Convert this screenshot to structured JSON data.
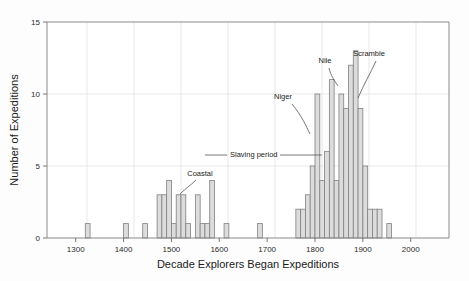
{
  "figure": {
    "name": "histogram-expeditions",
    "background_color": "#fdfdfd",
    "frame_color": "#888888",
    "grid_color": "#dddddd",
    "bar_fill": "#dcdcdc",
    "bar_stroke": "#808080",
    "text_color": "#1a1a1a"
  },
  "chart_data": {
    "type": "bar",
    "title": "",
    "subtitle": "",
    "xlabel": "Decade Explorers Began Expeditions",
    "ylabel": "Number of Expeditions",
    "xlim": [
      1240,
      2080
    ],
    "ylim": [
      0,
      15
    ],
    "xticks": [
      1300,
      1400,
      1500,
      1600,
      1700,
      1800,
      1900,
      2000
    ],
    "yticks": [
      0,
      5,
      10,
      15
    ],
    "xtick_labels": [
      "1300",
      "1400",
      "1500",
      "1600",
      "1700",
      "1800",
      "1900",
      "2000"
    ],
    "ytick_labels": [
      "0",
      "5",
      "10",
      "15"
    ],
    "grid": true,
    "grid_axis": "both",
    "legend": false,
    "bin_width": 10,
    "categories": [
      1320,
      1400,
      1440,
      1470,
      1480,
      1490,
      1500,
      1510,
      1520,
      1530,
      1550,
      1560,
      1570,
      1580,
      1610,
      1680,
      1760,
      1770,
      1780,
      1790,
      1800,
      1810,
      1820,
      1830,
      1840,
      1850,
      1860,
      1870,
      1880,
      1890,
      1900,
      1910,
      1920,
      1930,
      1950
    ],
    "values": [
      1,
      1,
      1,
      3,
      3,
      4,
      1,
      3,
      3,
      1,
      3,
      1,
      1,
      4,
      1,
      1,
      2,
      2,
      3,
      5,
      10,
      4,
      6,
      11,
      4,
      10,
      9,
      12,
      13,
      9,
      5,
      2,
      2,
      2,
      1
    ],
    "annotations": [
      {
        "id": "coastal",
        "text": "Coastal",
        "label_x": 200,
        "label_y": 176,
        "leader": "M 196 180 C 190 186, 186 188, 180 194"
      },
      {
        "id": "niger",
        "text": "Niger",
        "label_x": 283,
        "label_y": 99,
        "leader": "M 292 104 C 302 116, 306 126, 310 134"
      },
      {
        "id": "nile",
        "text": "Nile",
        "label_x": 325,
        "label_y": 63,
        "leader": "M 329 68 C 331 76, 334 80, 338 86"
      },
      {
        "id": "scramble",
        "text": "Scramble",
        "label_x": 369,
        "label_y": 56,
        "leader": "M 376 61 C 370 74, 364 84, 358 98"
      },
      {
        "id": "slaving-period",
        "text": "Slaving period",
        "label_x": 230,
        "label_y": 157,
        "line_from_x": 205,
        "line_to_x": 322,
        "line_y": 155
      }
    ]
  }
}
